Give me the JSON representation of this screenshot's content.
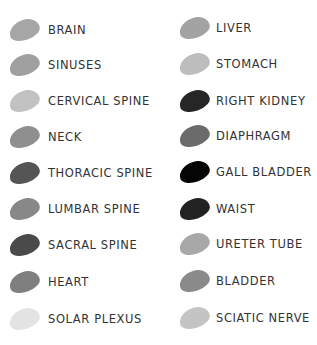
{
  "left": {
    "items": [
      {
        "label": "BRAIN",
        "color": "#a6a6a6"
      },
      {
        "label": "SINUSES",
        "color": "#a0a0a0"
      },
      {
        "label": "CERVICAL SPINE",
        "color": "#c2c2c2"
      },
      {
        "label": "NECK",
        "color": "#8f8f8f"
      },
      {
        "label": "THORACIC SPINE",
        "color": "#555555"
      },
      {
        "label": "LUMBAR SPINE",
        "color": "#888888"
      },
      {
        "label": "SACRAL SPINE",
        "color": "#4a4a4a"
      },
      {
        "label": "HEART",
        "color": "#7f7f7f"
      },
      {
        "label": "SOLAR PLEXUS",
        "color": "#e3e3e3"
      }
    ]
  },
  "right": {
    "items": [
      {
        "label": "LIVER",
        "color": "#a3a3a3"
      },
      {
        "label": "STOMACH",
        "color": "#bdbdbd"
      },
      {
        "label": "RIGHT KIDNEY",
        "color": "#262626"
      },
      {
        "label": "DIAPHRAGM",
        "color": "#6b6b6b"
      },
      {
        "label": "GALL BLADDER",
        "color": "#050505"
      },
      {
        "label": "WAIST",
        "color": "#222222"
      },
      {
        "label": "URETER TUBE",
        "color": "#a8a8a8"
      },
      {
        "label": "BLADDER",
        "color": "#8a8a8a"
      },
      {
        "label": "SCIATIC NERVE",
        "color": "#c4c4c4"
      }
    ]
  }
}
